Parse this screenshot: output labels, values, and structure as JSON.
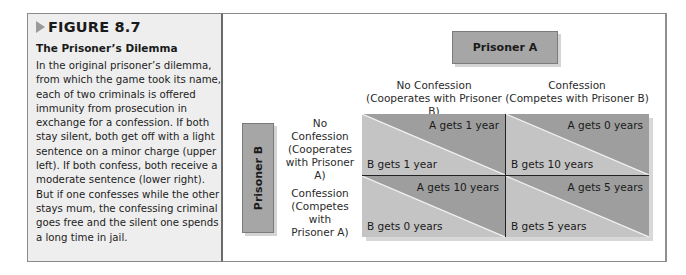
{
  "figure": {
    "label": "FIGURE 8.7",
    "title": "The Prisoner’s Dilemma",
    "caption": "In the original prisoner’s dilemma, from which the game took its name, each of two criminals is offered immunity from prosecution in exchange for a confession. If both stay silent, both get off with a light sentence on a minor charge (upper left). If both confess, both receive a moderate sentence (lower right). But if one confesses while the other stays mum, the confessing criminal goes free and the silent one spends a long time in jail."
  },
  "matrix": {
    "player_a": "Prisoner A",
    "player_b": "Prisoner B",
    "columns": [
      {
        "line1": "No Confession",
        "line2": "(Cooperates with Prisoner B)"
      },
      {
        "line1": "Confession",
        "line2": "(Competes with Prisoner B)"
      }
    ],
    "rows": [
      {
        "line1": "No",
        "line2": "Confession",
        "line3": "(Cooperates",
        "line4": "with Prisoner A)"
      },
      {
        "line1": "Confession",
        "line2": "(Competes with",
        "line3": "Prisoner A)"
      }
    ],
    "cells": [
      [
        {
          "a": "A gets 1 year",
          "b": "B gets 1 year"
        },
        {
          "a": "A gets 0 years",
          "b": "B gets 10 years"
        }
      ],
      [
        {
          "a": "A gets 10 years",
          "b": "B gets 0 years"
        },
        {
          "a": "A gets 5 years",
          "b": "B gets 5 years"
        }
      ]
    ]
  },
  "colors": {
    "upper_triangle": "#9e9e9e",
    "lower_triangle": "#c4c4c4",
    "label_box": "#a6a6a6",
    "caption_bg": "#eeeeee"
  }
}
